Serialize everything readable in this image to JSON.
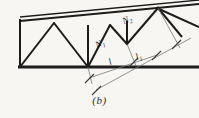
{
  "figure": {
    "caption": "(b)",
    "type": "truss-diagram",
    "background_color": "#f7f6f2",
    "line_color": "#1c1c1c",
    "dimension_line_color": "#6e6e6e",
    "member_labels": [
      {
        "id": "N1",
        "text": "N",
        "subscript": "1",
        "x": 98,
        "y": 46,
        "rotation": -22
      },
      {
        "id": "N2",
        "text": "N",
        "subscript": "2",
        "x": 127,
        "y": 22,
        "rotation": -22
      }
    ],
    "dimension_labels": [
      {
        "id": "l",
        "text": "l",
        "subscript": "",
        "x": 112,
        "y": 62,
        "rotation": -22
      },
      {
        "id": "l1",
        "text": "l",
        "subscript": "1",
        "x": 140,
        "y": 57,
        "rotation": -22
      }
    ],
    "geometry": {
      "bottom_chord": {
        "x1": 20,
        "y1": 67,
        "x2": 199,
        "y2": 67,
        "width": 2.6
      },
      "top_chord": {
        "x1": 20,
        "y1": 20,
        "x2": 199,
        "y2": 2,
        "width": 2.2
      },
      "left_vertical": {
        "x1": 20,
        "y1": 20,
        "x2": 20,
        "y2": 67,
        "width": 2.0
      },
      "verticals": [
        {
          "x1": 88,
          "y1": 26,
          "x2": 88,
          "y2": 67
        },
        {
          "x1": 127,
          "y1": 22,
          "x2": 127,
          "y2": 44
        }
      ],
      "diagonals": [
        {
          "x1": 20,
          "y1": 67,
          "x2": 54,
          "y2": 23
        },
        {
          "x1": 54,
          "y1": 23,
          "x2": 88,
          "y2": 67
        },
        {
          "x1": 88,
          "y1": 67,
          "x2": 110,
          "y2": 25
        },
        {
          "x1": 110,
          "y1": 25,
          "x2": 127,
          "y2": 44
        },
        {
          "x1": 127,
          "y1": 44,
          "x2": 158,
          "y2": 8
        },
        {
          "x1": 158,
          "y1": 8,
          "x2": 181,
          "y2": 36
        },
        {
          "x1": 158,
          "y1": 8,
          "x2": 199,
          "y2": 26
        }
      ],
      "dimension_lines": [
        {
          "id": "dim-l",
          "x1": 89,
          "y1": 78,
          "x2": 156,
          "y2": 55
        },
        {
          "id": "dim-l1",
          "x1": 96,
          "y1": 90,
          "x2": 190,
          "y2": 38
        }
      ],
      "tick_marks": [
        {
          "x": 89,
          "y": 78
        },
        {
          "x": 133,
          "y": 62
        },
        {
          "x": 96,
          "y": 90
        },
        {
          "x": 176,
          "y": 44
        },
        {
          "x": 156,
          "y": 55
        }
      ]
    }
  }
}
